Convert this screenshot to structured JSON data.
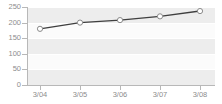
{
  "chart_data": {
    "type": "line",
    "title": "",
    "subtitle": "",
    "xlabel": "",
    "ylabel": "",
    "categories": [
      "3/04",
      "3/05",
      "3/06",
      "3/07",
      "3/08"
    ],
    "values": [
      180,
      200,
      208,
      220,
      237
    ],
    "series": [
      {
        "name": "series-1",
        "values": [
          180,
          200,
          208,
          220,
          237
        ]
      }
    ],
    "ylim": [
      0,
      250
    ],
    "y_ticks": [
      0,
      50,
      100,
      150,
      200,
      250
    ],
    "y_tick_labels": [
      "0",
      "50",
      "100",
      "150",
      "200",
      "250"
    ],
    "x_tick_labels": [
      "3/04",
      "3/05",
      "3/06",
      "3/07",
      "3/08"
    ],
    "grid": true,
    "grid_orientation": "horizontal",
    "legend": false,
    "legend_position": "none",
    "marker": "open-circle",
    "colors": {
      "line": "#3f3f3f",
      "marker_fill": "#ffffff",
      "marker_stroke": "#8a8a8a",
      "plot_background": "#fbfbfb",
      "band": "#ededed",
      "gridline": "#ffffff",
      "axis": "#b8b8b8",
      "tick_text": "#8d8d8d",
      "page_background": "#ffffff"
    }
  }
}
